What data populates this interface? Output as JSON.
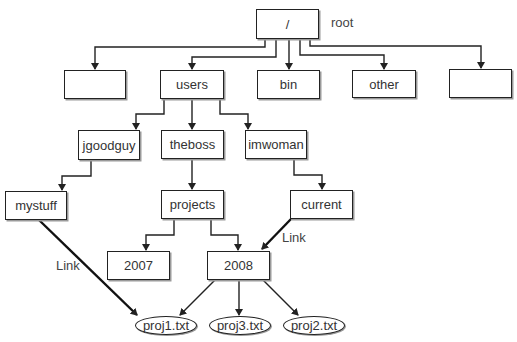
{
  "diagram": {
    "root": {
      "label": "/",
      "annotation": "root"
    },
    "level1": [
      {
        "label": ""
      },
      {
        "label": "users"
      },
      {
        "label": "bin"
      },
      {
        "label": "other"
      },
      {
        "label": ""
      }
    ],
    "users_children": [
      {
        "label": "jgoodguy"
      },
      {
        "label": "theboss"
      },
      {
        "label": "imwoman"
      }
    ],
    "level3": {
      "mystuff": "mystuff",
      "projects": "projects",
      "current": "current"
    },
    "projects_children": [
      {
        "label": "2007"
      },
      {
        "label": "2008"
      }
    ],
    "files": [
      {
        "label": "proj1.txt"
      },
      {
        "label": "proj3.txt"
      },
      {
        "label": "proj2.txt"
      }
    ],
    "links": [
      {
        "label": "Link",
        "from": "mystuff",
        "to": "proj1.txt"
      },
      {
        "label": "Link",
        "from": "current",
        "to": "2008"
      }
    ],
    "colors": {
      "line": "#222222",
      "text": "#333333",
      "shadow": "#9a9a9a"
    }
  }
}
